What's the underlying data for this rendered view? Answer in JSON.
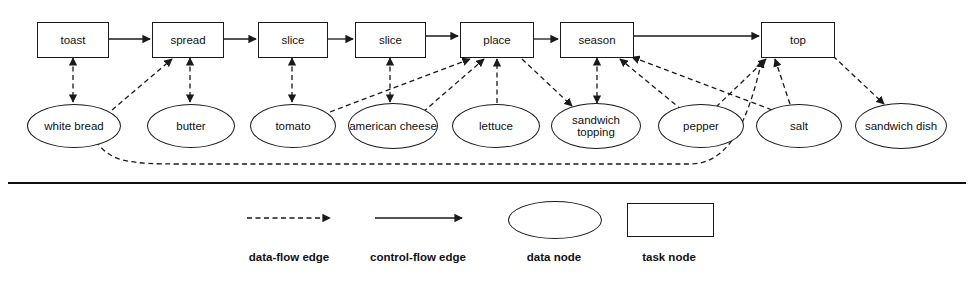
{
  "diagram": {
    "task_nodes": [
      {
        "id": "toast",
        "label": "toast",
        "x": 37,
        "y": 22,
        "w": 70,
        "h": 34
      },
      {
        "id": "spread",
        "label": "spread",
        "x": 152,
        "y": 22,
        "w": 70,
        "h": 34
      },
      {
        "id": "slice1",
        "label": "slice",
        "x": 258,
        "y": 22,
        "w": 68,
        "h": 34
      },
      {
        "id": "slice2",
        "label": "slice",
        "x": 355,
        "y": 22,
        "w": 69,
        "h": 34
      },
      {
        "id": "place",
        "label": "place",
        "x": 460,
        "y": 22,
        "w": 72,
        "h": 34
      },
      {
        "id": "season",
        "label": "season",
        "x": 560,
        "y": 22,
        "w": 72,
        "h": 34
      },
      {
        "id": "top",
        "label": "top",
        "x": 761,
        "y": 22,
        "w": 72,
        "h": 34
      }
    ],
    "data_nodes": [
      {
        "id": "white_bread",
        "label": "white bread",
        "cx": 73,
        "cy": 125,
        "rx": 46,
        "ry": 21
      },
      {
        "id": "butter",
        "label": "butter",
        "cx": 190,
        "cy": 125,
        "rx": 43,
        "ry": 21
      },
      {
        "id": "tomato",
        "label": "tomato",
        "cx": 292,
        "cy": 125,
        "rx": 42,
        "ry": 21
      },
      {
        "id": "american_cheese",
        "label": "american\ncheese",
        "cx": 392,
        "cy": 125,
        "rx": 44,
        "ry": 22
      },
      {
        "id": "lettuce",
        "label": "lettuce",
        "cx": 495,
        "cy": 125,
        "rx": 43,
        "ry": 21
      },
      {
        "id": "sandwich_topping",
        "label": "sandwich\ntopping",
        "cx": 595,
        "cy": 125,
        "rx": 44,
        "ry": 22
      },
      {
        "id": "pepper",
        "label": "pepper",
        "cx": 700,
        "cy": 125,
        "rx": 42,
        "ry": 21
      },
      {
        "id": "salt",
        "label": "salt",
        "cx": 798,
        "cy": 125,
        "rx": 42,
        "ry": 21
      },
      {
        "id": "sandwich_dish",
        "label": "sandwich\ndish",
        "cx": 900,
        "cy": 125,
        "rx": 45,
        "ry": 22
      }
    ],
    "control_flow_edges": [
      {
        "from": "toast",
        "to": "spread"
      },
      {
        "from": "spread",
        "to": "slice1"
      },
      {
        "from": "slice1",
        "to": "slice2"
      },
      {
        "from": "slice2",
        "to": "place"
      },
      {
        "from": "place",
        "to": "season"
      },
      {
        "from": "season",
        "to": "top"
      }
    ],
    "data_flow_edges": [
      {
        "from": "toast",
        "to": "white_bread",
        "bidirectional": true
      },
      {
        "from": "white_bread",
        "to": "spread",
        "bidirectional": false
      },
      {
        "from": "spread",
        "to": "butter",
        "bidirectional": true
      },
      {
        "from": "slice1",
        "to": "tomato",
        "bidirectional": true
      },
      {
        "from": "slice2",
        "to": "american_cheese",
        "bidirectional": true
      },
      {
        "from": "tomato",
        "to": "place",
        "bidirectional": false
      },
      {
        "from": "american_cheese",
        "to": "place",
        "bidirectional": false
      },
      {
        "from": "lettuce",
        "to": "place",
        "bidirectional": false
      },
      {
        "from": "place",
        "to": "sandwich_topping",
        "bidirectional": false
      },
      {
        "from": "season",
        "to": "sandwich_topping",
        "bidirectional": true
      },
      {
        "from": "pepper",
        "to": "season",
        "bidirectional": false
      },
      {
        "from": "salt",
        "to": "season",
        "bidirectional": false
      },
      {
        "from": "pepper",
        "to": "top",
        "bidirectional": false
      },
      {
        "from": "salt",
        "to": "top",
        "bidirectional": false
      },
      {
        "from": "white_bread",
        "to": "top",
        "bidirectional": false
      },
      {
        "from": "top",
        "to": "sandwich_dish",
        "bidirectional": false
      }
    ]
  },
  "legend": {
    "items": [
      {
        "id": "data-flow-edge",
        "label": "data-flow edge",
        "glyph": "dashed-arrow"
      },
      {
        "id": "control-flow-edge",
        "label": "control-flow edge",
        "glyph": "solid-arrow"
      },
      {
        "id": "data-node",
        "label": "data node",
        "glyph": "ellipse"
      },
      {
        "id": "task-node",
        "label": "task node",
        "glyph": "rectangle"
      }
    ]
  },
  "style": {
    "stroke": "#1a1a1a",
    "background": "#ffffff"
  }
}
